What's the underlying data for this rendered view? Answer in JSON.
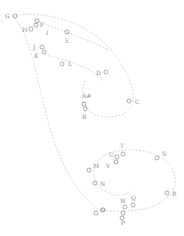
{
  "diagram": {
    "type": "labeled-point-path",
    "colors": {
      "point": "#8a8a8a",
      "path": "#c8c8c8",
      "background": "#ffffff"
    },
    "paths": [
      "M 13 16 C 40 10, 90 20, 115 55 C 140 90, 140 115, 110 117 C 85 118, 78 100, 85 80",
      "M 13 16 C 30 35, 35 70, 45 110 C 55 150, 70 190, 100 210",
      "M 45 55 C 70 60, 95 70, 102 80",
      "M 100 210 C 140 215, 170 205, 175 185 C 178 165, 160 150, 130 150 C 100 150, 90 165, 95 180 C 100 195, 125 200, 130 190",
      "M 35 20 C 60 30, 90 40, 108 50"
    ],
    "points": [
      {
        "id": "G",
        "label": "G",
        "cx": 15,
        "cy": 16,
        "lx": 5,
        "ly": 18,
        "anchor": "start"
      },
      {
        "id": "H",
        "label": "H",
        "cx": 31,
        "cy": 29,
        "lx": 22,
        "ly": 32,
        "anchor": "start"
      },
      {
        "id": "F",
        "label": "F",
        "cx": 36,
        "cy": 25,
        "lx": 40,
        "ly": 27,
        "anchor": "start"
      },
      {
        "id": "F2",
        "label": "",
        "cx": 37,
        "cy": 21,
        "lx": 0,
        "ly": 0,
        "anchor": "start"
      },
      {
        "id": "I",
        "label": "I",
        "cx": 0,
        "cy": 0,
        "lx": 46,
        "ly": 35,
        "anchor": "start",
        "no_circle": true
      },
      {
        "id": "E",
        "label": "E",
        "cx": 67,
        "cy": 32,
        "lx": 65,
        "ly": 43,
        "anchor": "start"
      },
      {
        "id": "J",
        "label": "J",
        "cx": 42,
        "cy": 47,
        "lx": 33,
        "ly": 49,
        "anchor": "start"
      },
      {
        "id": "K",
        "label": "K",
        "cx": 44,
        "cy": 52,
        "lx": 34,
        "ly": 58,
        "anchor": "start"
      },
      {
        "id": "L",
        "label": "L",
        "cx": 62,
        "cy": 64,
        "lx": 68,
        "ly": 66,
        "anchor": "start"
      },
      {
        "id": "D",
        "label": "D",
        "cx": 106,
        "cy": 72,
        "lx": 96,
        "ly": 75,
        "anchor": "start"
      },
      {
        "id": "C",
        "label": "C",
        "cx": 129,
        "cy": 101,
        "lx": 135,
        "ly": 104,
        "anchor": "start"
      },
      {
        "id": "A",
        "label": "A#",
        "cx": 0,
        "cy": 0,
        "lx": 82,
        "ly": 98,
        "anchor": "start",
        "no_circle": true
      },
      {
        "id": "A1",
        "label": "",
        "cx": 84,
        "cy": 104,
        "lx": 0,
        "ly": 0,
        "anchor": "start"
      },
      {
        "id": "A2",
        "label": "",
        "cx": 85,
        "cy": 109,
        "lx": 0,
        "ly": 0,
        "anchor": "start"
      },
      {
        "id": "B",
        "label": "B",
        "cx": 0,
        "cy": 0,
        "lx": 82,
        "ly": 119,
        "anchor": "start",
        "no_circle": true
      },
      {
        "id": "T",
        "label": "T",
        "cx": 123,
        "cy": 154,
        "lx": 120,
        "ly": 148,
        "anchor": "start"
      },
      {
        "id": "U",
        "label": "U",
        "cx": 117,
        "cy": 157,
        "lx": 109,
        "ly": 157,
        "anchor": "start"
      },
      {
        "id": "U2",
        "label": "",
        "cx": 116,
        "cy": 162,
        "lx": 0,
        "ly": 0,
        "anchor": "start"
      },
      {
        "id": "V",
        "label": "V",
        "cx": 0,
        "cy": 0,
        "lx": 106,
        "ly": 168,
        "anchor": "start",
        "no_circle": true
      },
      {
        "id": "S",
        "label": "S",
        "cx": 157,
        "cy": 158,
        "lx": 162,
        "ly": 156,
        "anchor": "start"
      },
      {
        "id": "M",
        "label": "M",
        "cx": 89,
        "cy": 170,
        "lx": 93,
        "ly": 168,
        "anchor": "start"
      },
      {
        "id": "N",
        "label": "N",
        "cx": 95,
        "cy": 183,
        "lx": 100,
        "ly": 186,
        "anchor": "start"
      },
      {
        "id": "R",
        "label": "R",
        "cx": 167,
        "cy": 193,
        "lx": 172,
        "ly": 196,
        "anchor": "start"
      },
      {
        "id": "W",
        "label": "W",
        "cx": 125,
        "cy": 207,
        "lx": 120,
        "ly": 203,
        "anchor": "start"
      },
      {
        "id": "Q",
        "label": "Q",
        "cx": 133,
        "cy": 205,
        "lx": 131,
        "ly": 200,
        "anchor": "start"
      },
      {
        "id": "O",
        "label": "O",
        "cx": 96,
        "cy": 213,
        "lx": 100,
        "ly": 212,
        "anchor": "start",
        "circle_left": true
      },
      {
        "id": "O2",
        "label": "",
        "cx": 103,
        "cy": 210,
        "lx": 0,
        "ly": 0,
        "anchor": "start"
      },
      {
        "id": "P",
        "label": "P",
        "cx": 123,
        "cy": 213,
        "lx": 121,
        "ly": 225,
        "anchor": "start"
      },
      {
        "id": "P2",
        "label": "",
        "cx": 122,
        "cy": 218,
        "lx": 0,
        "ly": 0,
        "anchor": "start"
      }
    ]
  }
}
